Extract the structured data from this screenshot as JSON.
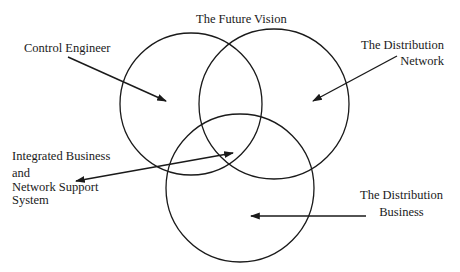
{
  "diagram": {
    "type": "venn",
    "title": "The Future Vision",
    "circles": [
      {
        "id": "control-engineer",
        "label": "Control Engineer"
      },
      {
        "id": "distribution-network",
        "label": "The Distribution Network"
      },
      {
        "id": "distribution-business",
        "label": "The Distribution Business"
      }
    ],
    "center_label": "Integrated Business and Network Support System",
    "colors": {
      "stroke": "#1a1a1a",
      "background": "#ffffff"
    }
  },
  "labels": {
    "future_vision": "The Future Vision",
    "control_engineer": "Control Engineer",
    "distribution_network": {
      "line1": "The Distribution",
      "line2": "Network"
    },
    "integrated": {
      "line1": "Integrated Business",
      "line2": "and",
      "line3": "Network Support",
      "line4": "System"
    },
    "distribution_business": {
      "line1": "The Distribution",
      "line2": "Business"
    }
  }
}
